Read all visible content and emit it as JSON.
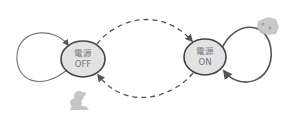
{
  "diagram": {
    "type": "state-diagram",
    "states": [
      {
        "id": "off",
        "line1": "電源",
        "line2": "OFF"
      },
      {
        "id": "on",
        "line1": "電源",
        "line2": "ON"
      }
    ],
    "transitions": [
      {
        "from": "off",
        "to": "off",
        "style": "solid",
        "kind": "self-loop"
      },
      {
        "from": "off",
        "to": "on",
        "style": "dashed"
      },
      {
        "from": "on",
        "to": "off",
        "style": "dashed"
      },
      {
        "from": "on",
        "to": "on",
        "style": "solid",
        "kind": "self-loop"
      }
    ],
    "decorations": [
      {
        "name": "sketch-figure-icon",
        "position": "below-off-state"
      },
      {
        "name": "sketch-figure-icon",
        "position": "top-right-of-on-state"
      }
    ],
    "colors": {
      "state_fill": "#e2e2e2",
      "state_stroke": "#444444",
      "arrow_stroke": "#555555",
      "label": "#777777",
      "decoration": "#b5b5b5"
    }
  }
}
